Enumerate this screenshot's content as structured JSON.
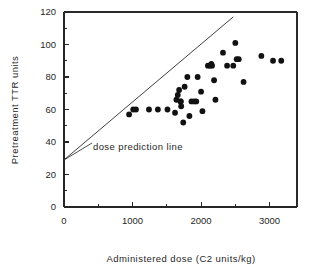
{
  "chart_data": {
    "type": "scatter",
    "title": "",
    "xlabel": "Administered dose (C2 units/kg)",
    "ylabel": "Pretreatment TTR units",
    "xlim": [
      0,
      3400
    ],
    "ylim": [
      0,
      120
    ],
    "grid": false,
    "legend": null,
    "xticks": [
      0,
      1000,
      2000,
      3000
    ],
    "xtick_labels": [
      "0",
      "1000",
      "2000",
      "3000"
    ],
    "xticks_minor": [
      500,
      1500,
      2500
    ],
    "yticks": [
      0,
      20,
      40,
      60,
      80,
      100,
      120
    ],
    "ytick_labels": [
      "0",
      "20",
      "40",
      "60",
      "80",
      "100",
      "120"
    ],
    "yticks_minor": [
      10,
      30,
      50,
      70,
      90,
      110
    ],
    "annotations": [
      {
        "text": "dose prediction line",
        "x": 780,
        "y": 45
      }
    ],
    "series": [
      {
        "name": "dose prediction line",
        "type": "line",
        "x": [
          0,
          2470
        ],
        "y": [
          29,
          117
        ]
      },
      {
        "name": "patients",
        "type": "scatter",
        "points": [
          [
            950,
            57
          ],
          [
            1010,
            60
          ],
          [
            1050,
            60
          ],
          [
            1240,
            60
          ],
          [
            1370,
            60
          ],
          [
            1510,
            60
          ],
          [
            1620,
            58
          ],
          [
            1640,
            66
          ],
          [
            1660,
            69
          ],
          [
            1680,
            72
          ],
          [
            1700,
            65
          ],
          [
            1705,
            65
          ],
          [
            1710,
            62
          ],
          [
            1740,
            52
          ],
          [
            1760,
            74
          ],
          [
            1800,
            80
          ],
          [
            1830,
            56
          ],
          [
            1860,
            65
          ],
          [
            1900,
            65
          ],
          [
            1930,
            65
          ],
          [
            1950,
            80
          ],
          [
            2000,
            71
          ],
          [
            2020,
            59
          ],
          [
            2100,
            87
          ],
          [
            2130,
            87
          ],
          [
            2150,
            88
          ],
          [
            2160,
            87
          ],
          [
            2190,
            78
          ],
          [
            2210,
            66
          ],
          [
            2320,
            95
          ],
          [
            2380,
            87
          ],
          [
            2470,
            87
          ],
          [
            2500,
            101
          ],
          [
            2520,
            91
          ],
          [
            2550,
            91
          ],
          [
            2620,
            77
          ],
          [
            2880,
            93
          ],
          [
            3050,
            90
          ],
          [
            3170,
            90
          ]
        ]
      }
    ]
  }
}
